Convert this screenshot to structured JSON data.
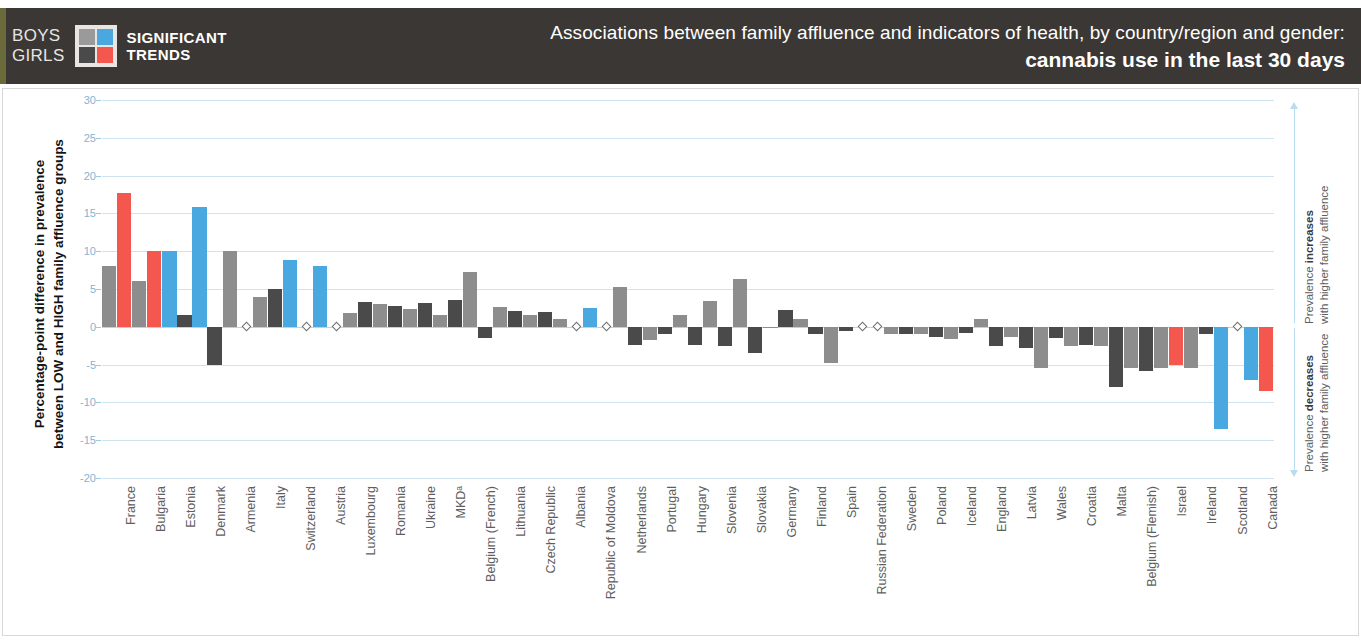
{
  "header": {
    "legend_row1": "BOYS",
    "legend_row2": "GIRLS",
    "trend_line1": "SIGNIFICANT",
    "trend_line2": "TRENDS",
    "title_line1": "Associations between family affluence and indicators of health, by country/region and gender:",
    "title_line2": "cannabis use in the last 30 days",
    "bg_color": "#3b3734",
    "swatch": {
      "boys_nonsig": "#9a9a9a",
      "boys_sig": "#4aa8e0",
      "girls_nonsig": "#4a4a4a",
      "girls_sig": "#f4574e"
    }
  },
  "axis": {
    "y_title_line1": "Percentage-point difference in prevalence",
    "y_title_line2": "between LOW and HIGH family affluence groups",
    "ticks": [
      30,
      25,
      20,
      15,
      10,
      5,
      0,
      -5,
      -10,
      -15,
      -20
    ]
  },
  "annotations": {
    "increase_line1": "Prevalence ",
    "increase_bold": "increases",
    "increase_line2": "with higher family affluence",
    "decrease_line1": "Prevalence ",
    "decrease_bold": "decreases",
    "decrease_line2": "with higher family affluence"
  },
  "colors": {
    "boys_nonsig": "#8d8d8d",
    "boys_sig": "#4aa8e0",
    "girls_nonsig": "#4a4a4a",
    "girls_sig": "#f4574e",
    "gridline": "#cfe3f0",
    "tick_text": "#7fb4d4",
    "label_text": "#5e5e5e"
  },
  "chart_data": {
    "type": "bar",
    "title": "Associations between family affluence and indicators of health, by country/region and gender: cannabis use in the last 30 days",
    "xlabel": "",
    "ylabel": "Percentage-point difference in prevalence between LOW and HIGH family affluence groups",
    "ylim": [
      -20,
      30
    ],
    "ytick_step": 5,
    "grid": true,
    "legend_position": "header",
    "legend": [
      "BOYS",
      "GIRLS",
      "SIGNIFICANT TRENDS"
    ],
    "categories": [
      "France",
      "Bulgaria",
      "Estonia",
      "Denmark",
      "Armenia",
      "Italy",
      "Switzerland",
      "Austria",
      "Luxembourg",
      "Romania",
      "Ukraine",
      "MKDᵃ",
      "Belgium (French)",
      "Lithuania",
      "Czech Republic",
      "Albania",
      "Republic of Moldova",
      "Netherlands",
      "Portugal",
      "Hungary",
      "Slovenia",
      "Slovakia",
      "Germany",
      "Finland",
      "Spain",
      "Russian Federation",
      "Sweden",
      "Poland",
      "Iceland",
      "England",
      "Latvia",
      "Wales",
      "Croatia",
      "Malta",
      "Belgium (Flemish)",
      "Israel",
      "Ireland",
      "Scotland",
      "Canada"
    ],
    "series": [
      {
        "name": "Boys",
        "values": [
          8.0,
          6.0,
          10.0,
          15.8,
          10.0,
          4.0,
          8.9,
          8.0,
          1.8,
          3.0,
          2.3,
          1.5,
          7.2,
          2.6,
          1.6,
          1.0,
          2.5,
          5.2,
          -1.8,
          1.5,
          3.4,
          6.3,
          -0.2,
          1.0,
          -4.8,
          0.0,
          -0.9,
          -1.0,
          -1.6,
          1.0,
          -1.3,
          -5.5,
          -2.5,
          -2.5,
          -5.5,
          -5.5,
          -5.5,
          -13.5,
          -7.0
        ],
        "significant": [
          false,
          false,
          true,
          true,
          false,
          false,
          true,
          true,
          false,
          false,
          false,
          false,
          false,
          false,
          false,
          false,
          true,
          false,
          false,
          false,
          false,
          false,
          false,
          false,
          false,
          false,
          false,
          false,
          false,
          false,
          false,
          false,
          false,
          false,
          false,
          false,
          false,
          true,
          true
        ]
      },
      {
        "name": "Girls",
        "values": [
          17.7,
          10.0,
          1.6,
          -5.0,
          0.0,
          5.0,
          0.0,
          0.0,
          3.3,
          2.7,
          3.1,
          3.6,
          -1.5,
          2.1,
          2.0,
          0.0,
          0.0,
          -2.4,
          -1.0,
          -2.4,
          -2.5,
          -3.4,
          2.2,
          -0.9,
          -0.5,
          0.0,
          -1.0,
          -1.3,
          -0.8,
          -2.6,
          -2.8,
          -1.5,
          -2.4,
          -7.9,
          -5.8,
          -5.0,
          -1.0,
          0.0,
          -8.5
        ],
        "significant": [
          true,
          true,
          false,
          false,
          false,
          false,
          false,
          false,
          false,
          false,
          false,
          false,
          false,
          false,
          false,
          false,
          false,
          false,
          false,
          false,
          false,
          false,
          false,
          false,
          false,
          false,
          false,
          false,
          false,
          false,
          false,
          false,
          false,
          false,
          false,
          true,
          false,
          false,
          true
        ]
      }
    ],
    "zero_markers": [
      {
        "category": "Armenia",
        "series": "Girls"
      },
      {
        "category": "Switzerland",
        "series": "Girls"
      },
      {
        "category": "Austria",
        "series": "Girls"
      },
      {
        "category": "Albania",
        "series": "Girls"
      },
      {
        "category": "Republic of Moldova",
        "series": "Girls"
      },
      {
        "category": "Russian Federation",
        "series": "Boys"
      }
    ],
    "footnote_symbol": "MKDᵃ"
  }
}
